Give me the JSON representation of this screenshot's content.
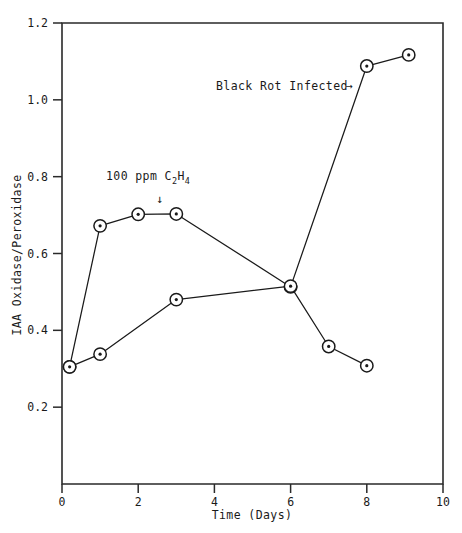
{
  "chart_data": {
    "type": "line",
    "title": "",
    "xlabel": "Time (Days)",
    "ylabel": "IAA Oxidase/Peroxidase",
    "xlim": [
      0,
      10
    ],
    "ylim": [
      0,
      1.2
    ],
    "grid": false,
    "legend_position": "none",
    "xticks": [
      0,
      2,
      4,
      6,
      8,
      10
    ],
    "xtick_labels": [
      "0",
      "2",
      "4",
      "6",
      "8",
      "10"
    ],
    "yticks": [
      0.2,
      0.4,
      0.6,
      0.8,
      1.0,
      1.2
    ],
    "ytick_labels": [
      "0.2",
      "0.4",
      "0.6",
      "0.8",
      "1.0",
      "1.2"
    ],
    "marker_style": "open-circle-with-center-dot",
    "series": [
      {
        "name": "Black Rot Infected",
        "x": [
          0.2,
          1.0,
          2.0,
          3.0,
          6.0,
          8.0,
          9.1
        ],
        "y": [
          0.305,
          0.672,
          0.702,
          0.703,
          0.513,
          1.088,
          1.117
        ]
      },
      {
        "name": "Control",
        "x": [
          0.2,
          1.0,
          3.0,
          6.0,
          7.0,
          8.0
        ],
        "y": [
          0.305,
          0.338,
          0.48,
          0.515,
          0.358,
          0.308
        ]
      }
    ],
    "annotations": [
      {
        "id": "black-rot-label",
        "text": "Black Rot Infected",
        "arrow": "right",
        "arrow_glyph": "→",
        "x": 4.0,
        "y": 1.0
      },
      {
        "id": "ethylene-label",
        "text": "100 ppm C2H4",
        "text_main": "100 ppm C",
        "text_sub1": "2",
        "text_mid": "H",
        "text_sub2": "4",
        "arrow": "down",
        "arrow_glyph": "↓",
        "x": 2.4,
        "y": 0.79
      }
    ]
  },
  "axes": {
    "y_axis_title": "IAA Oxidase/Peroxidase",
    "x_axis_title": "Time (Days)"
  },
  "colors": {
    "line": "#1a1a1a",
    "axis": "#2a2a2a",
    "marker_fill": "#ffffff",
    "background": "#ffffff"
  }
}
